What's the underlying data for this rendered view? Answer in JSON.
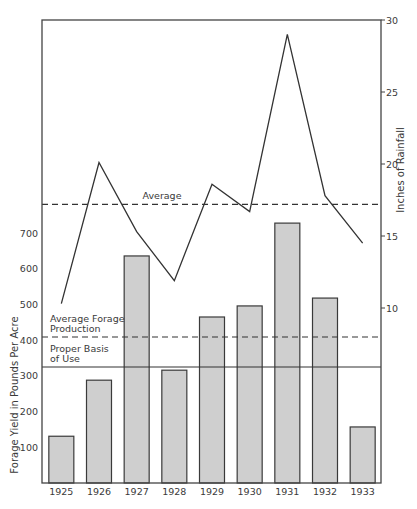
{
  "chart_data": {
    "type": "bar+line",
    "title": "",
    "categories": [
      "1925",
      "1926",
      "1927",
      "1928",
      "1929",
      "1930",
      "1931",
      "1932",
      "1933"
    ],
    "series": [
      {
        "name": "Forage Yield",
        "type": "bar",
        "axis": "left",
        "values": [
          131,
          288,
          636,
          316,
          465,
          496,
          728,
          518,
          157
        ],
        "color": "#cfcfcf"
      },
      {
        "name": "Inches of Rainfall",
        "type": "line",
        "axis": "right",
        "values": [
          10.3,
          20.1,
          15.3,
          11.9,
          18.6,
          16.7,
          29.0,
          17.8,
          14.5
        ],
        "color": "#333333"
      }
    ],
    "left_axis": {
      "label": "Forage Yield in Pounds Per Acre",
      "ticks": [
        100,
        200,
        300,
        400,
        500,
        600,
        700
      ],
      "ylim": [
        0,
        700
      ]
    },
    "right_axis": {
      "label": "Inches of Rainfall",
      "ticks": [
        10,
        15,
        20,
        25,
        30
      ],
      "ylim": [
        0,
        30
      ]
    },
    "reference_lines": [
      {
        "label": "Average",
        "axis": "right",
        "value": 17.2,
        "style": "dashed"
      },
      {
        "label_lines": [
          "Average Forage",
          "Production"
        ],
        "axis": "left",
        "value": 409,
        "style": "dashed"
      },
      {
        "label_lines": [
          "Proper Basis",
          "of Use"
        ],
        "axis": "left",
        "value": 325,
        "style": "solid"
      }
    ],
    "xlabel": "",
    "grid": false,
    "legend": "none"
  }
}
